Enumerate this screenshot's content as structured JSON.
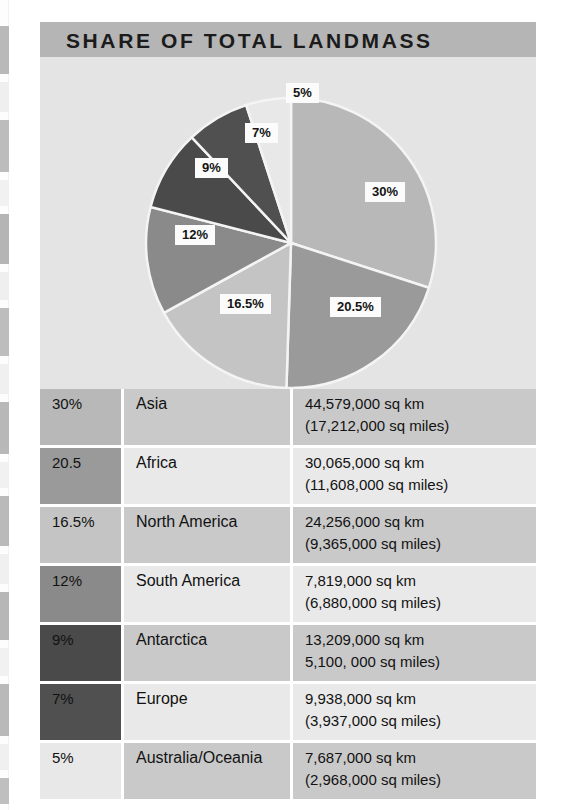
{
  "title": "SHARE OF TOTAL LANDMASS",
  "colors": {
    "title_band": "#b5b5b5",
    "pie_background": "#e4e4e4",
    "band_dark": "#c9c9c9",
    "band_light": "#e9e9e9",
    "label_background": "#fbfbfb",
    "text": "#121212"
  },
  "chart_data": {
    "type": "pie",
    "title": "SHARE OF TOTAL LANDMASS",
    "start_angle_deg": 0,
    "direction": "clockwise",
    "legend": "table",
    "categories": [
      "Asia",
      "Africa",
      "North America",
      "South America",
      "Antarctica",
      "Europe",
      "Australia/Oceania"
    ],
    "values": [
      30,
      20.5,
      16.5,
      12,
      9,
      7,
      5
    ],
    "slice_labels": [
      "30%",
      "20.5%",
      "16.5%",
      "12%",
      "9%",
      "7%",
      "5%"
    ],
    "slice_colors": [
      "#b8b8b8",
      "#9a9a9a",
      "#c4c4c4",
      "#8a8a8a",
      "#4a4a4a",
      "#505050",
      "#e8e8e8"
    ],
    "unit": "percent of total landmass"
  },
  "table": {
    "rows": [
      {
        "pct": "30%",
        "name": "Asia",
        "area_km": "44,579,000 sq km",
        "area_miles": "(17,212,000 sq miles)",
        "swatch": "#b8b8b8"
      },
      {
        "pct": "20.5",
        "name": "Africa",
        "area_km": "30,065,000 sq km",
        "area_miles": "(11,608,000 sq miles)",
        "swatch": "#9a9a9a"
      },
      {
        "pct": "16.5%",
        "name": "North America",
        "area_km": "24,256,000 sq km",
        "area_miles": "(9,365,000 sq miles)",
        "swatch": "#c4c4c4"
      },
      {
        "pct": "12%",
        "name": "South America",
        "area_km": "7,819,000 sq km",
        "area_miles": "(6,880,000 sq miles)",
        "swatch": "#8a8a8a"
      },
      {
        "pct": "9%",
        "name": "Antarctica",
        "area_km": "13,209,000 sq km",
        "area_miles": "5,100, 000 sq miles)",
        "swatch": "#4a4a4a"
      },
      {
        "pct": "7%",
        "name": "Europe",
        "area_km": "9,938,000 sq km",
        "area_miles": "(3,937,000 sq miles)",
        "swatch": "#505050"
      },
      {
        "pct": "5%",
        "name": "Australia/Oceania",
        "area_km": "7,687,000 sq km",
        "area_miles": "(2,968,000 sq miles)",
        "swatch": "#e8e8e8"
      }
    ]
  }
}
